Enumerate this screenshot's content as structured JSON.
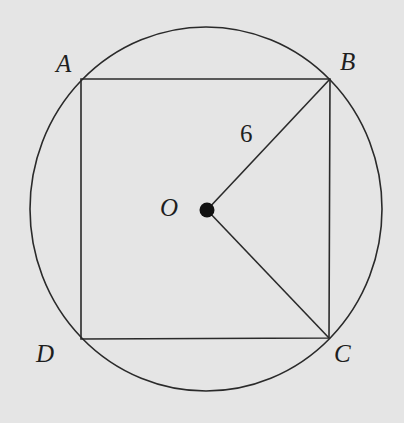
{
  "diagram": {
    "type": "circle-inscribed-square",
    "background": "#e5e5e5",
    "stroke_color": "#2a2a2a",
    "circle": {
      "cx": 206,
      "cy": 209,
      "rx": 176,
      "ry": 182
    },
    "square": {
      "A": [
        81,
        79
      ],
      "B": [
        330,
        79
      ],
      "C": [
        329,
        338
      ],
      "D": [
        81,
        339
      ]
    },
    "center": {
      "x": 207,
      "y": 210,
      "r": 7.5
    },
    "segments": [
      {
        "from": "O",
        "to": "B"
      },
      {
        "from": "O",
        "to": "C"
      }
    ],
    "labels": {
      "A": "A",
      "B": "B",
      "C": "C",
      "D": "D",
      "O": "O",
      "radius_OB": "6"
    }
  }
}
